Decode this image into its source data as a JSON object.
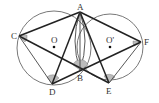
{
  "figure": {
    "type": "geometry",
    "points": {
      "A": "A",
      "B": "B",
      "C": "C",
      "D": "D",
      "E": "E",
      "F": "F",
      "O": "O",
      "O_prime": "O'"
    },
    "segments": [
      "AC",
      "AF",
      "AD",
      "AE",
      "AB",
      "CE",
      "DF",
      "CD",
      "EF"
    ],
    "marked_angles": [
      "C",
      "D",
      "B",
      "E",
      "F"
    ],
    "colors": {
      "line": "#222222",
      "angle_fill": "#bbbbbb",
      "background": "#ffffff"
    }
  }
}
